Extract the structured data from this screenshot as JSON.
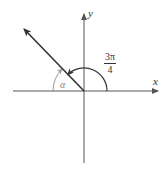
{
  "diagram": {
    "type": "unit-angle-diagram",
    "axes": {
      "x_label": "x",
      "y_label": "y"
    },
    "angle": {
      "numerator": "3π",
      "denominator": "4",
      "value_label": "3π/4"
    },
    "reference_angle": {
      "label": "α"
    },
    "colors": {
      "axis": "#555555",
      "ray": "#333333",
      "arc": "#333333",
      "reference_arc": "#999999"
    }
  }
}
